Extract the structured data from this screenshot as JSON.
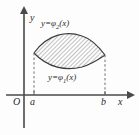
{
  "figure": {
    "kind": "math-diagram",
    "axes": {
      "x_axis_label": "x",
      "y_axis_label": "y",
      "origin_label": "O"
    },
    "ticks": [
      {
        "name": "a",
        "label": "a"
      },
      {
        "name": "b",
        "label": "b"
      }
    ],
    "curve_labels": {
      "upper": {
        "lhs": "y",
        "eq": "=",
        "fn": "φ",
        "subscript": "2",
        "arg": "(x)"
      },
      "lower": {
        "lhs": "y",
        "eq": "=",
        "fn": "φ",
        "subscript": "1",
        "arg": "(x)"
      }
    },
    "colors": {
      "background": "#fdfdfd",
      "axis": "#4a4a4a",
      "curve": "#3c3c3c",
      "hatch": "#5f5f5f",
      "dashed": "#6e6e6e",
      "text": "#2b2b2b"
    },
    "geometry": {
      "origin_px": {
        "x": 24,
        "y": 95
      },
      "a_px": 34,
      "b_px": 105,
      "upper_curve_path": "M 34 53 C 48 33, 68 31, 82 36 C 92 39, 99 47, 105 55",
      "lower_curve_path": "M 34 53 C 48 68, 66 71, 82 67 C 92 64, 99 59, 105 55",
      "x_axis_end_px": 133,
      "y_axis_top_px": 8,
      "y_axis_bottom_px": 128
    }
  }
}
